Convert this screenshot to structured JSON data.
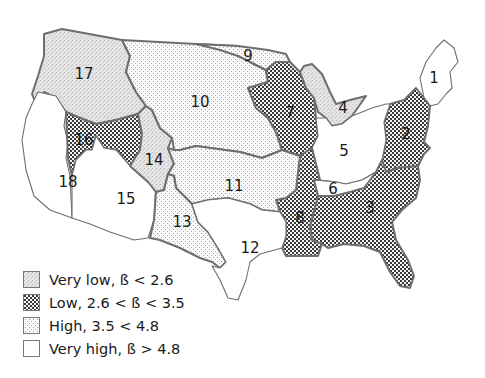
{
  "map": {
    "regions": [
      {
        "id": "1",
        "label": "1",
        "category": "very_high"
      },
      {
        "id": "2",
        "label": "2",
        "category": "low"
      },
      {
        "id": "3",
        "label": "3",
        "category": "low"
      },
      {
        "id": "4",
        "label": "4",
        "category": "very_low"
      },
      {
        "id": "5",
        "label": "5",
        "category": "very_high"
      },
      {
        "id": "6",
        "label": "6",
        "category": "very_high"
      },
      {
        "id": "7",
        "label": "7",
        "category": "low"
      },
      {
        "id": "8",
        "label": "8",
        "category": "low"
      },
      {
        "id": "9",
        "label": "9",
        "category": "high"
      },
      {
        "id": "10",
        "label": "10",
        "category": "high"
      },
      {
        "id": "11",
        "label": "11",
        "category": "high"
      },
      {
        "id": "12",
        "label": "12",
        "category": "very_high"
      },
      {
        "id": "13",
        "label": "13",
        "category": "high"
      },
      {
        "id": "14",
        "label": "14",
        "category": "very_low"
      },
      {
        "id": "15",
        "label": "15",
        "category": "very_high"
      },
      {
        "id": "16",
        "label": "16",
        "category": "low"
      },
      {
        "id": "17",
        "label": "17",
        "category": "very_low"
      },
      {
        "id": "18",
        "label": "18",
        "category": "very_high"
      }
    ]
  },
  "legend": {
    "items": [
      {
        "key": "very_low",
        "label": "Very low, ß < 2.6",
        "pattern": "fine-gray-stipple"
      },
      {
        "key": "low",
        "label": "Low, 2.6 < ß < 3.5",
        "pattern": "dark-checker"
      },
      {
        "key": "high",
        "label": "High, 3.5 < 4.8",
        "pattern": "sparse-dots"
      },
      {
        "key": "very_high",
        "label": "Very high, ß > 4.8",
        "pattern": "blank"
      }
    ]
  }
}
